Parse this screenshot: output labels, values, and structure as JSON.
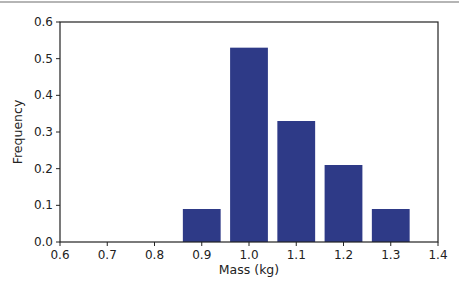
{
  "chart_data": {
    "type": "bar",
    "title": "",
    "xlabel": "Mass (kg)",
    "ylabel": "Frequency",
    "categories": [
      "0.9",
      "1.0",
      "1.1",
      "1.2",
      "1.3"
    ],
    "x": [
      0.9,
      1.0,
      1.1,
      1.2,
      1.3
    ],
    "values": [
      0.09,
      0.53,
      0.33,
      0.21,
      0.09
    ],
    "bar_width": 0.08,
    "xlim": [
      0.6,
      1.4
    ],
    "ylim": [
      0.0,
      0.6
    ],
    "xticks": [
      "0.6",
      "0.7",
      "0.8",
      "0.9",
      "1.0",
      "1.1",
      "1.2",
      "1.3",
      "1.4"
    ],
    "yticks": [
      "0.0",
      "0.1",
      "0.2",
      "0.3",
      "0.4",
      "0.5",
      "0.6"
    ],
    "grid": false,
    "legend": null,
    "bar_color": "#2e3a87"
  }
}
